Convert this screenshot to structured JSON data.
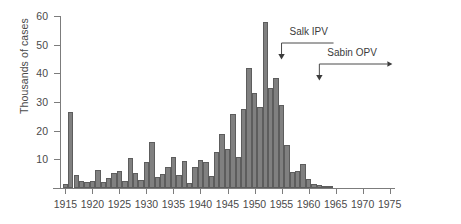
{
  "chart_data": {
    "type": "bar",
    "title": "",
    "subtitle": "",
    "xlabel": "",
    "ylabel": "Thousands of cases",
    "ylim": [
      0,
      60
    ],
    "xlim": [
      1914,
      1976
    ],
    "grid": false,
    "legend": null,
    "bar_color": "#808080",
    "bar_edge_color": "#5d5d5d",
    "axis_color": "#7c7c7c",
    "y_ticks": [
      10,
      20,
      30,
      40,
      50,
      60
    ],
    "y_tick_labels": [
      "10",
      "20",
      "30",
      "40",
      "50",
      "60"
    ],
    "x_ticks": [
      1915,
      1920,
      1925,
      1930,
      1935,
      1940,
      1945,
      1950,
      1955,
      1960,
      1965,
      1970,
      1975
    ],
    "x_tick_labels": [
      "1915",
      "1920",
      "1925",
      "1930",
      "1935",
      "1940",
      "1945",
      "1950",
      "1955",
      "1960",
      "1965",
      "1970",
      "1975"
    ],
    "x": [
      1915,
      1916,
      1917,
      1918,
      1919,
      1920,
      1921,
      1922,
      1923,
      1924,
      1925,
      1926,
      1927,
      1928,
      1929,
      1930,
      1931,
      1932,
      1933,
      1934,
      1935,
      1936,
      1937,
      1938,
      1939,
      1940,
      1941,
      1942,
      1943,
      1944,
      1945,
      1946,
      1947,
      1948,
      1949,
      1950,
      1951,
      1952,
      1953,
      1954,
      1955,
      1956,
      1957,
      1958,
      1959,
      1960,
      1961,
      1962,
      1963,
      1964
    ],
    "values": [
      1.5,
      26.5,
      4.5,
      2.5,
      2.0,
      2.3,
      6.3,
      2.1,
      3.6,
      5.3,
      6.0,
      2.5,
      10.5,
      5.2,
      2.8,
      9.2,
      15.9,
      3.8,
      5.0,
      7.5,
      10.8,
      4.5,
      9.5,
      1.7,
      7.3,
      9.8,
      9.0,
      4.2,
      12.4,
      19.0,
      13.6,
      25.7,
      10.8,
      27.7,
      42.0,
      33.3,
      28.4,
      57.9,
      35.0,
      38.5,
      28.9,
      15.1,
      5.5,
      5.8,
      8.4,
      3.2,
      1.3,
      0.9,
      0.4,
      0.1
    ]
  },
  "annotations": {
    "salk": {
      "label": "Salk IPV",
      "year": 1955
    },
    "sabin": {
      "label": "Sabin OPV",
      "year": 1962
    }
  }
}
